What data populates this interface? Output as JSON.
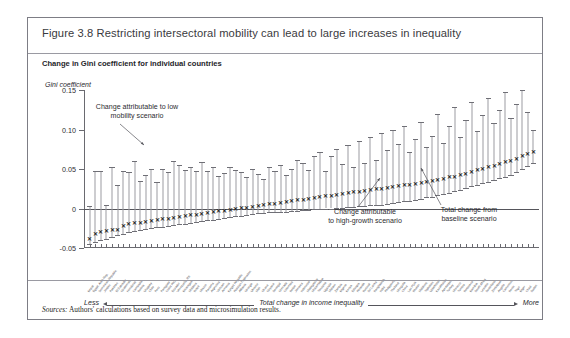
{
  "figure": {
    "title": "Figure 3.8  Restricting intersectoral mobility can lead to large increases in inequality",
    "subtitle": "Change in Gini coefficient for individual countries",
    "sources_label": "Sources:",
    "sources_text": " Authors' calculations based on survey data and microsimulation results."
  },
  "annotations": {
    "low_mobility": "Change attributable to low\nmobility scenario",
    "high_growth": "Change attributable\nto high-growth scenario",
    "baseline": "Total change from\nbaseline scenario"
  },
  "axis_explain": {
    "less": "Less",
    "center": "Total change in income inequality",
    "more": "More"
  },
  "chart_data": {
    "type": "line",
    "title": "Change in Gini coefficient for individual countries",
    "ylabel": "Gini coefficient",
    "xlabel": "Total change in income inequality",
    "ylim": [
      -0.05,
      0.15
    ],
    "yticks": [
      -0.05,
      0,
      0.05,
      0.1,
      0.15
    ],
    "ytick_labels": [
      "-0.05",
      "0",
      "0.05",
      "0.10",
      "0.15"
    ],
    "grid": false,
    "legend": "none",
    "series_description": "Each country shows a vertical range bar: the lower cap is the high-growth scenario change, the upper cap is the low-mobility scenario change, and the X marker is the total change from the baseline scenario.",
    "categories": [
      "Nepal",
      "Egypt, Arab Rep.",
      "Dominican Republic",
      "Jordan",
      "Pakistan",
      "El Salvador",
      "Guatemala",
      "Honduras",
      "Cambodia",
      "Bolivia",
      "Uruguay",
      "Chile",
      "Peru",
      "Paraguay",
      "Costa Rica",
      "Ecuador",
      "Venezuela, RB",
      "Nicaragua",
      "Moldova",
      "Brazil",
      "Mexico",
      "Panama",
      "Argentina",
      "Vietnam",
      "Armenia",
      "Kyrgyz Republic",
      "Russian Federation",
      "Albania",
      "Georgia",
      "Ukraine",
      "Mali",
      "Ghana",
      "Guyana",
      "Senegal",
      "Grenada",
      "Colombia",
      "Belize",
      "Jamaica",
      "Indonesia",
      "Madagascar",
      "Mozambique",
      "Tanzania",
      "Uganda",
      "Malawi",
      "Zambia",
      "Nigeria",
      "Kenya",
      "Ethiopia",
      "Rwanda",
      "Burundi",
      "Sri Lanka",
      "Bangladesh",
      "India",
      "Philippines",
      "Thailand",
      "Mongolia",
      "China",
      "Lao PDR",
      "Bhutan",
      "Maldives",
      "Tajikistan",
      "Uzbekistan",
      "Kazakhstan",
      "Azerbaijan",
      "Turkey",
      "Morocco",
      "Tunisia",
      "Botswana",
      "Namibia",
      "South Africa",
      "Lesotho",
      "Swaziland",
      "Zimbabwe",
      "Angola",
      "Cameroon",
      "Benin",
      "Togo",
      "Niger",
      "Chad",
      "Sudan"
    ],
    "series": [
      {
        "name": "Total change from baseline scenario",
        "marker": "x",
        "values": [
          -0.04,
          -0.033,
          -0.031,
          -0.03,
          -0.029,
          -0.028,
          -0.024,
          -0.021,
          -0.02,
          -0.019,
          -0.018,
          -0.017,
          -0.016,
          -0.015,
          -0.014,
          -0.013,
          -0.012,
          -0.011,
          -0.01,
          -0.009,
          -0.008,
          -0.007,
          -0.006,
          -0.005,
          -0.004,
          -0.003,
          -0.002,
          -0.001,
          0.0,
          0.001,
          0.002,
          0.003,
          0.004,
          0.005,
          0.006,
          0.007,
          0.008,
          0.009,
          0.01,
          0.011,
          0.012,
          0.013,
          0.014,
          0.015,
          0.016,
          0.017,
          0.018,
          0.019,
          0.02,
          0.021,
          0.022,
          0.023,
          0.024,
          0.025,
          0.026,
          0.027,
          0.028,
          0.029,
          0.03,
          0.031,
          0.032,
          0.033,
          0.035,
          0.036,
          0.038,
          0.039,
          0.041,
          0.043,
          0.045,
          0.047,
          0.049,
          0.051,
          0.053,
          0.055,
          0.057,
          0.059,
          0.062,
          0.065,
          0.068,
          0.07
        ]
      },
      {
        "name": "Change attributable to low mobility scenario (upper cap)",
        "marker": "cap",
        "values": [
          0.003,
          0.048,
          0.047,
          0.005,
          0.052,
          0.03,
          0.047,
          0.046,
          0.06,
          0.035,
          0.042,
          0.05,
          0.033,
          0.05,
          0.046,
          0.06,
          0.055,
          0.049,
          0.052,
          0.047,
          0.059,
          0.047,
          0.052,
          0.041,
          0.045,
          0.053,
          0.049,
          0.046,
          0.04,
          0.05,
          0.044,
          0.037,
          0.052,
          0.048,
          0.055,
          0.043,
          0.05,
          0.061,
          0.058,
          0.049,
          0.066,
          0.072,
          0.048,
          0.067,
          0.075,
          0.056,
          0.08,
          0.052,
          0.085,
          0.058,
          0.09,
          0.062,
          0.095,
          0.074,
          0.1,
          0.082,
          0.105,
          0.071,
          0.088,
          0.11,
          0.078,
          0.092,
          0.12,
          0.083,
          0.105,
          0.128,
          0.09,
          0.112,
          0.135,
          0.098,
          0.118,
          0.14,
          0.108,
          0.125,
          0.148,
          0.115,
          0.132,
          0.15,
          0.122,
          0.1
        ]
      },
      {
        "name": "Change attributable to high-growth scenario (lower cap)",
        "marker": "cap",
        "values": [
          -0.045,
          -0.042,
          -0.04,
          -0.038,
          -0.036,
          -0.034,
          -0.032,
          -0.03,
          -0.028,
          -0.027,
          -0.026,
          -0.025,
          -0.024,
          -0.023,
          -0.022,
          -0.021,
          -0.02,
          -0.019,
          -0.018,
          -0.017,
          -0.016,
          -0.015,
          -0.014,
          -0.013,
          -0.012,
          -0.011,
          -0.01,
          -0.009,
          -0.008,
          -0.007,
          -0.006,
          -0.006,
          -0.005,
          -0.005,
          -0.004,
          -0.004,
          -0.003,
          -0.003,
          -0.002,
          -0.002,
          -0.001,
          -0.001,
          0.0,
          0.0,
          0.001,
          0.001,
          0.002,
          0.002,
          0.003,
          0.003,
          0.004,
          0.005,
          0.005,
          0.006,
          0.007,
          0.008,
          0.009,
          0.01,
          0.011,
          0.012,
          0.014,
          0.015,
          0.017,
          0.018,
          0.02,
          0.022,
          0.024,
          0.026,
          0.028,
          0.03,
          0.032,
          0.034,
          0.036,
          0.038,
          0.04,
          0.043,
          0.046,
          0.05,
          0.054,
          0.058
        ]
      }
    ]
  }
}
